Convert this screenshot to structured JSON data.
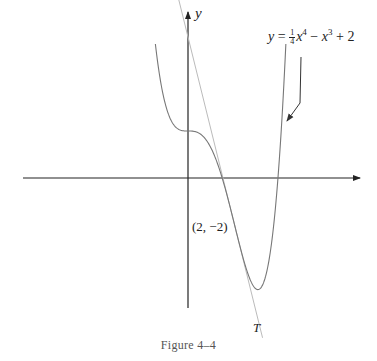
{
  "figure": {
    "caption": "Figure 4–4",
    "y_axis_label": "y",
    "equation": {
      "lhs": "y",
      "eq": "=",
      "frac_num": "1",
      "frac_den": "4",
      "term1_var": "x",
      "term1_exp": "4",
      "minus": "−",
      "term2_var": "x",
      "term2_exp": "3",
      "plus": "+",
      "const": "2"
    },
    "point_label": "(2, −2)",
    "tangent_label": "T"
  },
  "chart_data": {
    "type": "line",
    "title": "Figure 4–4",
    "xlabel": "",
    "ylabel": "y",
    "function": "y = (1/4)x^4 - x^3 + 2",
    "series": [
      {
        "name": "y = ¼x⁴ − x³ + 2",
        "x": [
          -1.4,
          -1.0,
          -0.5,
          0,
          0.5,
          1.0,
          1.5,
          2.0,
          2.5,
          3.0,
          3.5,
          4.0,
          4.2
        ],
        "y": [
          5.7,
          3.25,
          2.14,
          2.0,
          1.89,
          1.25,
          -0.11,
          -2.0,
          -3.86,
          -4.75,
          -3.86,
          2.0,
          5.09
        ]
      },
      {
        "name": "T (tangent at (2, −2))",
        "x": [
          -0.6,
          3.2
        ],
        "y": [
          8.4,
          -6.8
        ],
        "slope": -4
      }
    ],
    "annotations": [
      {
        "text": "(2, −2)",
        "x": 2,
        "y": -2
      },
      {
        "text": "T",
        "target": "tangent line"
      },
      {
        "text": "y = ¼x⁴ − x³ + 2",
        "target": "curve",
        "arrow": true
      }
    ],
    "axes": {
      "x_arrow": true,
      "y_arrow": true,
      "ticks": false
    },
    "grid": false,
    "legend": "none"
  },
  "style": {
    "axis_color": "#222222",
    "curve_color": "#777777",
    "tangent_color": "#bbbbbb"
  }
}
